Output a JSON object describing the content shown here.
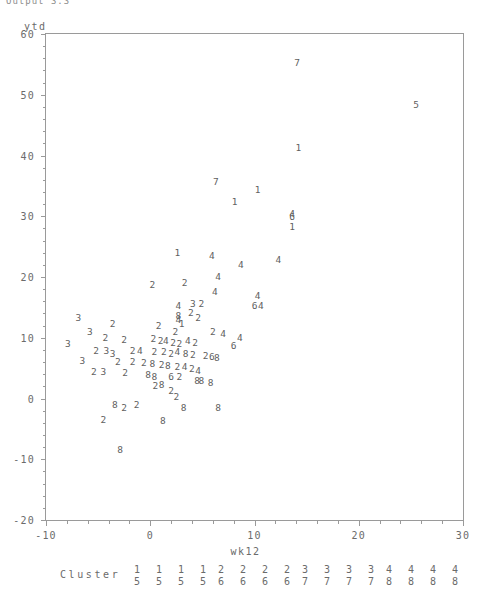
{
  "window": {
    "top_caption": "Output  3.3"
  },
  "chart_data": {
    "type": "scatter",
    "title": "",
    "xlabel": "wk12",
    "ylabel": "ytd",
    "xlim": [
      -10,
      30
    ],
    "ylim": [
      -20,
      60
    ],
    "xticks": [
      -10,
      0,
      10,
      20,
      30
    ],
    "yticks": [
      -20,
      -10,
      0,
      10,
      20,
      30,
      40,
      50,
      60
    ],
    "xtick_labels": [
      "-10",
      "0",
      "10",
      "20",
      "30"
    ],
    "ytick_labels": [
      "-20",
      "-10",
      "0",
      "10",
      "20",
      "30",
      "40",
      "50",
      "60"
    ],
    "minor_ticks_per_interval": 5,
    "grid": false,
    "marker_style": "cluster-number-glyph",
    "legend": {
      "position": "below-axis",
      "title": "Cluster",
      "entries": [
        {
          "top": "1",
          "bottom": "5"
        },
        {
          "top": "1",
          "bottom": "5"
        },
        {
          "top": "1",
          "bottom": "5"
        },
        {
          "top": "1",
          "bottom": "5"
        },
        {
          "top": "2",
          "bottom": "6"
        },
        {
          "top": "2",
          "bottom": "6"
        },
        {
          "top": "2",
          "bottom": "6"
        },
        {
          "top": "2",
          "bottom": "6"
        },
        {
          "top": "3",
          "bottom": "7"
        },
        {
          "top": "3",
          "bottom": "7"
        },
        {
          "top": "3",
          "bottom": "7"
        },
        {
          "top": "3",
          "bottom": "7"
        },
        {
          "top": "4",
          "bottom": "8"
        },
        {
          "top": "4",
          "bottom": "8"
        },
        {
          "top": "4",
          "bottom": "8"
        },
        {
          "top": "4",
          "bottom": "8"
        }
      ]
    },
    "points": [
      {
        "label": "7",
        "x": 14.1,
        "y": 55.3
      },
      {
        "label": "5",
        "x": 25.5,
        "y": 48.3
      },
      {
        "label": "1",
        "x": 14.2,
        "y": 41.2
      },
      {
        "label": "7",
        "x": 6.3,
        "y": 35.6
      },
      {
        "label": "1",
        "x": 10.3,
        "y": 34.3
      },
      {
        "label": "1",
        "x": 8.1,
        "y": 32.3
      },
      {
        "label": "4",
        "x": 13.6,
        "y": 30.3
      },
      {
        "label": "6",
        "x": 13.6,
        "y": 29.8
      },
      {
        "label": "1",
        "x": 13.6,
        "y": 28.2
      },
      {
        "label": "1",
        "x": 2.6,
        "y": 24.0
      },
      {
        "label": "4",
        "x": 5.9,
        "y": 23.5
      },
      {
        "label": "4",
        "x": 12.3,
        "y": 22.8
      },
      {
        "label": "4",
        "x": 8.7,
        "y": 22.0
      },
      {
        "label": "4",
        "x": 6.5,
        "y": 20.0
      },
      {
        "label": "2",
        "x": 0.2,
        "y": 18.7
      },
      {
        "label": "2",
        "x": 3.3,
        "y": 19.0
      },
      {
        "label": "4",
        "x": 6.2,
        "y": 17.5
      },
      {
        "label": "4",
        "x": 10.3,
        "y": 16.8
      },
      {
        "label": "6",
        "x": 10.0,
        "y": 15.3
      },
      {
        "label": "4",
        "x": 10.6,
        "y": 15.3
      },
      {
        "label": "3",
        "x": 4.1,
        "y": 15.5
      },
      {
        "label": "2",
        "x": 4.9,
        "y": 15.5
      },
      {
        "label": "4",
        "x": 2.7,
        "y": 15.3
      },
      {
        "label": "2",
        "x": 3.9,
        "y": 14.0
      },
      {
        "label": "2",
        "x": 4.6,
        "y": 13.3
      },
      {
        "label": "3",
        "x": -6.9,
        "y": 13.3
      },
      {
        "label": "8",
        "x": 2.7,
        "y": 13.6
      },
      {
        "label": "4",
        "x": 2.7,
        "y": 13.0
      },
      {
        "label": "2",
        "x": -3.6,
        "y": 12.2
      },
      {
        "label": "1",
        "x": 3.0,
        "y": 12.2
      },
      {
        "label": "2",
        "x": 0.8,
        "y": 11.9
      },
      {
        "label": "3",
        "x": -5.8,
        "y": 11.0
      },
      {
        "label": "2",
        "x": 2.4,
        "y": 11.0
      },
      {
        "label": "2",
        "x": 6.0,
        "y": 11.0
      },
      {
        "label": "4",
        "x": 7.0,
        "y": 10.6
      },
      {
        "label": "4",
        "x": 8.6,
        "y": 10.0
      },
      {
        "label": "2",
        "x": -4.3,
        "y": 10.0
      },
      {
        "label": "2",
        "x": -2.5,
        "y": 9.7
      },
      {
        "label": "2",
        "x": 0.3,
        "y": 9.8
      },
      {
        "label": "2",
        "x": 1.0,
        "y": 9.5
      },
      {
        "label": "4",
        "x": 1.5,
        "y": 9.5
      },
      {
        "label": "2",
        "x": 2.2,
        "y": 9.2
      },
      {
        "label": "2",
        "x": 2.8,
        "y": 9.0
      },
      {
        "label": "4",
        "x": 3.6,
        "y": 9.5
      },
      {
        "label": "2",
        "x": 4.3,
        "y": 9.1
      },
      {
        "label": "3",
        "x": -7.9,
        "y": 9.0
      },
      {
        "label": "6",
        "x": 8.0,
        "y": 8.6
      },
      {
        "label": "2",
        "x": -5.2,
        "y": 7.9
      },
      {
        "label": "3",
        "x": -4.2,
        "y": 7.9
      },
      {
        "label": "3",
        "x": -3.6,
        "y": 7.4
      },
      {
        "label": "2",
        "x": -1.7,
        "y": 7.8
      },
      {
        "label": "4",
        "x": -1.0,
        "y": 7.9
      },
      {
        "label": "2",
        "x": 0.4,
        "y": 7.7
      },
      {
        "label": "2",
        "x": 1.3,
        "y": 7.6
      },
      {
        "label": "2",
        "x": 2.0,
        "y": 7.4
      },
      {
        "label": "4",
        "x": 2.6,
        "y": 7.6
      },
      {
        "label": "8",
        "x": 3.4,
        "y": 7.4
      },
      {
        "label": "2",
        "x": 4.1,
        "y": 7.1
      },
      {
        "label": "2",
        "x": 5.3,
        "y": 7.0
      },
      {
        "label": "6",
        "x": 5.9,
        "y": 6.8
      },
      {
        "label": "8",
        "x": 6.4,
        "y": 6.6
      },
      {
        "label": "3",
        "x": -6.5,
        "y": 6.2
      },
      {
        "label": "2",
        "x": -3.1,
        "y": 6.0
      },
      {
        "label": "2",
        "x": -1.7,
        "y": 6.0
      },
      {
        "label": "2",
        "x": -0.6,
        "y": 5.8
      },
      {
        "label": "8",
        "x": 0.2,
        "y": 5.6
      },
      {
        "label": "2",
        "x": 1.1,
        "y": 5.5
      },
      {
        "label": "8",
        "x": 1.7,
        "y": 5.4
      },
      {
        "label": "2",
        "x": 2.6,
        "y": 5.2
      },
      {
        "label": "4",
        "x": 3.3,
        "y": 5.2
      },
      {
        "label": "2",
        "x": 4.0,
        "y": 4.8
      },
      {
        "label": "4",
        "x": 4.6,
        "y": 4.5
      },
      {
        "label": "2",
        "x": -5.4,
        "y": 4.3
      },
      {
        "label": "3",
        "x": -4.5,
        "y": 4.3
      },
      {
        "label": "2",
        "x": -2.4,
        "y": 4.2
      },
      {
        "label": "8",
        "x": -0.2,
        "y": 3.9
      },
      {
        "label": "8",
        "x": 0.4,
        "y": 3.6
      },
      {
        "label": "6",
        "x": 2.0,
        "y": 3.5
      },
      {
        "label": "2",
        "x": 2.8,
        "y": 3.6
      },
      {
        "label": "8",
        "x": 4.5,
        "y": 2.8
      },
      {
        "label": "8",
        "x": 4.9,
        "y": 2.8
      },
      {
        "label": "8",
        "x": 5.8,
        "y": 2.6
      },
      {
        "label": "2",
        "x": 0.5,
        "y": 2.0
      },
      {
        "label": "8",
        "x": 1.1,
        "y": 2.3
      },
      {
        "label": "2",
        "x": 2.0,
        "y": 1.3
      },
      {
        "label": "2",
        "x": 2.5,
        "y": 0.2
      },
      {
        "label": "8",
        "x": -3.4,
        "y": -1.0
      },
      {
        "label": "2",
        "x": -2.5,
        "y": -1.6
      },
      {
        "label": "2",
        "x": -1.3,
        "y": -1.1
      },
      {
        "label": "8",
        "x": 3.2,
        "y": -1.6
      },
      {
        "label": "8",
        "x": 6.5,
        "y": -1.5
      },
      {
        "label": "2",
        "x": -4.5,
        "y": -3.5
      },
      {
        "label": "8",
        "x": 1.2,
        "y": -3.7
      },
      {
        "label": "8",
        "x": -2.9,
        "y": -8.4
      }
    ]
  }
}
